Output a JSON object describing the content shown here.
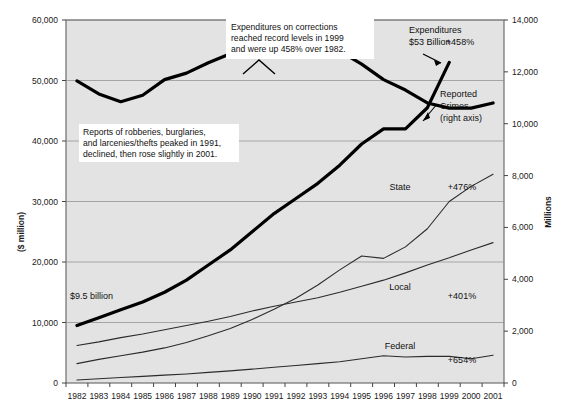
{
  "chart_data": {
    "type": "line",
    "title": "",
    "xlabel": "",
    "ylabel": "($ million)",
    "y2label": "Millions",
    "grid": true,
    "legend_position": "inline-labels",
    "categories": [
      "1982",
      "1983",
      "1984",
      "1985",
      "1986",
      "1987",
      "1988",
      "1989",
      "1990",
      "1991",
      "1992",
      "1993",
      "1994",
      "1995",
      "1996",
      "1997",
      "1998",
      "1999",
      "2000",
      "2001"
    ],
    "ylim": [
      0,
      60000
    ],
    "yticks": [
      0,
      10000,
      20000,
      30000,
      40000,
      50000,
      60000
    ],
    "ytick_labels": [
      "0",
      "10,000",
      "20,000",
      "30,000",
      "40,000",
      "50,000",
      "60,000"
    ],
    "y2lim": [
      0,
      14000
    ],
    "y2ticks": [
      0,
      2000,
      4000,
      6000,
      8000,
      10000,
      12000,
      14000
    ],
    "y2tick_labels": [
      "0",
      "2,000",
      "4,000",
      "6,000",
      "8,000",
      "10,000",
      "12,000",
      "14,000"
    ],
    "series": [
      {
        "name": "Reported Crimes",
        "axis": "right",
        "style": "thick",
        "color": "#000000",
        "values": [
          11650,
          11150,
          10850,
          11100,
          11700,
          11950,
          12350,
          12700,
          13100,
          13400,
          13100,
          12900,
          12800,
          12300,
          11700,
          11300,
          10800,
          10600,
          10600,
          10800
        ]
      },
      {
        "name": "Total Expenditures",
        "axis": "left",
        "style": "thick",
        "color": "#000000",
        "values": [
          9500,
          10800,
          12100,
          13400,
          15000,
          17000,
          19500,
          22000,
          25000,
          28000,
          30500,
          33000,
          36000,
          39500,
          42000,
          42000,
          45500,
          53000,
          null,
          null
        ]
      },
      {
        "name": "State",
        "axis": "left",
        "style": "thin",
        "color": "#2b2b2b",
        "values": [
          3200,
          3900,
          4500,
          5100,
          5800,
          6700,
          7800,
          9000,
          10500,
          12200,
          14000,
          16200,
          18700,
          21000,
          20600,
          22500,
          25500,
          30000,
          32500,
          34500
        ]
      },
      {
        "name": "Local",
        "axis": "left",
        "style": "thin",
        "color": "#2b2b2b",
        "values": [
          6200,
          6800,
          7500,
          8100,
          8800,
          9500,
          10200,
          11000,
          11900,
          12700,
          13400,
          14100,
          15000,
          16000,
          17000,
          18200,
          19500,
          20700,
          22000,
          23200
        ]
      },
      {
        "name": "Federal",
        "axis": "left",
        "style": "thin",
        "color": "#2b2b2b",
        "values": [
          500,
          700,
          900,
          1100,
          1300,
          1500,
          1750,
          2000,
          2300,
          2600,
          2900,
          3200,
          3500,
          4000,
          4500,
          4300,
          4400,
          4400,
          4000,
          4600
        ]
      }
    ],
    "annotations": [
      {
        "id": "corrections-callout",
        "lines": [
          "Expenditures on corrections",
          "reached record levels in 1999",
          "and were up 458% over 1982."
        ]
      },
      {
        "id": "crime-peak-note",
        "lines": [
          "Reports of robberies, burglaries,",
          "and larcenies/thefts peaked in 1991,",
          "declined,  then rose slightly in 2001."
        ]
      },
      {
        "id": "expenditures-pointer",
        "lines": [
          "Expenditures",
          "$53 Billion"
        ]
      },
      {
        "id": "reported-crimes-pointer",
        "lines": [
          "Reported",
          "Crimes",
          "(right axis)"
        ]
      },
      {
        "id": "start-value-label",
        "lines": [
          "$9.5 billion"
        ]
      }
    ],
    "series_inline_labels": [
      {
        "name": "State",
        "pct": "+476%"
      },
      {
        "name": "Local",
        "pct": "+401%"
      },
      {
        "name": "Federal",
        "pct": "+654%"
      }
    ],
    "total_pct_label": "+458%"
  }
}
